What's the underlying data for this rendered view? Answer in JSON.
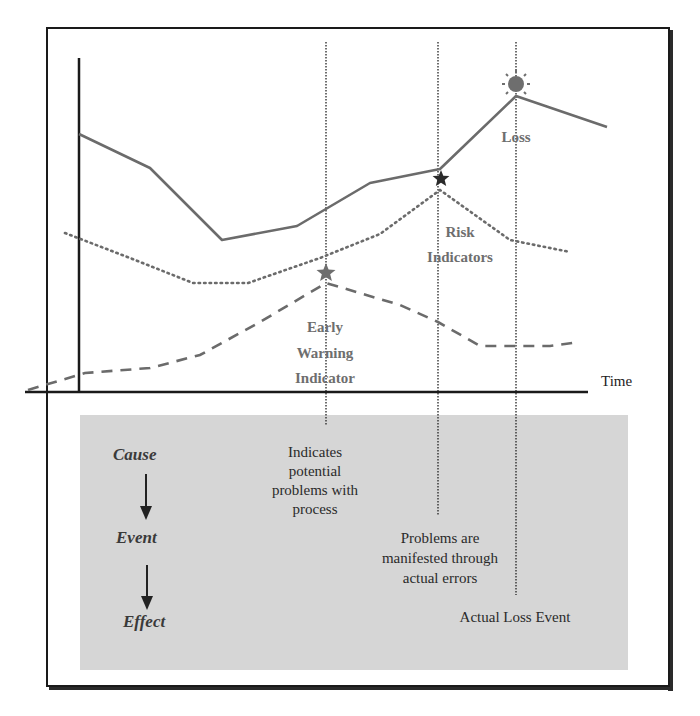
{
  "diagram": {
    "x_axis_label": "Time",
    "labels": {
      "loss": "Loss",
      "risk_indicators_line1": "Risk",
      "risk_indicators_line2": "Indicators",
      "early_warning_line1": "Early",
      "early_warning_line2": "Warning",
      "early_warning_line3": "Indicator"
    },
    "chain": {
      "cause": "Cause",
      "event": "Event",
      "effect": "Effect"
    },
    "descriptions": {
      "early_warning_line1": "Indicates",
      "early_warning_line2": "potential",
      "early_warning_line3": "problems with",
      "early_warning_line4": "process",
      "risk_line1": "Problems are",
      "risk_line2": "manifested through",
      "risk_line3": "actual errors",
      "loss_line1": "Actual Loss Event"
    },
    "series": [
      {
        "name": "Loss",
        "style": "solid",
        "color": "#6b6b6b",
        "points": [
          [
            79,
            134
          ],
          [
            150,
            168
          ],
          [
            222,
            240
          ],
          [
            297,
            226
          ],
          [
            370,
            183
          ],
          [
            440,
            169
          ],
          [
            516,
            96
          ],
          [
            607,
            127
          ]
        ]
      },
      {
        "name": "Risk Indicators",
        "style": "dotted",
        "color": "#6b6b6b",
        "points": [
          [
            65,
            233
          ],
          [
            130,
            258
          ],
          [
            193,
            283
          ],
          [
            248,
            283
          ],
          [
            320,
            258
          ],
          [
            380,
            234
          ],
          [
            440,
            190
          ],
          [
            510,
            240
          ],
          [
            570,
            252
          ]
        ]
      },
      {
        "name": "Early Warning Indicator",
        "style": "dashed",
        "color": "#6b6b6b",
        "points": [
          [
            28,
            390
          ],
          [
            85,
            373
          ],
          [
            150,
            368
          ],
          [
            200,
            355
          ],
          [
            260,
            322
          ],
          [
            326,
            283
          ],
          [
            400,
            305
          ],
          [
            438,
            322
          ],
          [
            480,
            346
          ],
          [
            550,
            346
          ],
          [
            580,
            342
          ]
        ]
      }
    ],
    "markers": {
      "early_warning_star_color": "#6e6e6e",
      "risk_star_color": "#2a2a2a",
      "loss_sun_color": "#6e6e6e"
    },
    "colors": {
      "frame": "#1a1a1a",
      "box_fill": "#d6d6d6",
      "line": "#6b6b6b"
    }
  }
}
